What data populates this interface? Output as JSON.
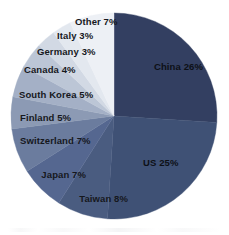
{
  "chart_data": {
    "type": "pie",
    "title": "",
    "subtitle": "",
    "xlabel": "",
    "ylabel": "",
    "legend_position": "none",
    "grid": false,
    "label_format": "{name} {value}%",
    "start_angle_deg": 0,
    "direction": "clockwise",
    "total": 100,
    "categories": [
      "China",
      "US",
      "Taiwan",
      "Japan",
      "Switzerland",
      "Finland",
      "South Korea",
      "Canada",
      "Germany",
      "Italy",
      "Other"
    ],
    "values": [
      26,
      25,
      8,
      7,
      7,
      5,
      5,
      4,
      3,
      3,
      7
    ],
    "colors": [
      "#333F61",
      "#3F5175",
      "#4A5C80",
      "#556790",
      "#6B7C9E",
      "#8C9AB4",
      "#A4B0C6",
      "#BCC6D6",
      "#D2D9E4",
      "#E3E8EF",
      "#EDF0F5"
    ],
    "slices": [
      {
        "name": "China",
        "value": 26,
        "label": "China 26%",
        "color": "#333F61",
        "label_placement": "inside",
        "label_x": 154,
        "label_y": 67,
        "align": "start"
      },
      {
        "name": "US",
        "value": 25,
        "label": "US 25%",
        "color": "#3F5175",
        "label_placement": "inside",
        "label_x": 143,
        "label_y": 163,
        "align": "start"
      },
      {
        "name": "Taiwan",
        "value": 8,
        "label": "Taiwan 8%",
        "color": "#4A5C80",
        "label_placement": "outside",
        "label_x": 128,
        "label_y": 199,
        "align": "end"
      },
      {
        "name": "Japan",
        "value": 7,
        "label": "Japan 7%",
        "color": "#556790",
        "label_placement": "outside",
        "label_x": 86,
        "label_y": 175,
        "align": "end"
      },
      {
        "name": "Switzerland",
        "value": 7,
        "label": "Switzerland 7%",
        "color": "#6B7C9E",
        "label_placement": "outside",
        "label_x": 20,
        "label_y": 141,
        "align": "start"
      },
      {
        "name": "Finland",
        "value": 5,
        "label": "Finland 5%",
        "color": "#8C9AB4",
        "label_placement": "outside",
        "label_x": 20,
        "label_y": 118,
        "align": "start"
      },
      {
        "name": "South Korea",
        "value": 5,
        "label": "South Korea 5%",
        "color": "#A4B0C6",
        "label_placement": "outside",
        "label_x": 19,
        "label_y": 95,
        "align": "start"
      },
      {
        "name": "Canada",
        "value": 4,
        "label": "Canada 4%",
        "color": "#BCC6D6",
        "label_placement": "outside",
        "label_x": 24,
        "label_y": 70,
        "align": "start"
      },
      {
        "name": "Germany",
        "value": 3,
        "label": "Germany 3%",
        "color": "#D2D9E4",
        "label_placement": "outside",
        "label_x": 37,
        "label_y": 52,
        "align": "start"
      },
      {
        "name": "Italy",
        "value": 3,
        "label": "Italy 3%",
        "color": "#E3E8EF",
        "label_placement": "outside",
        "label_x": 57,
        "label_y": 36,
        "align": "start"
      },
      {
        "name": "Other",
        "value": 7,
        "label": "Other 7%",
        "color": "#EDF0F5",
        "label_placement": "outside",
        "label_x": 75,
        "label_y": 22,
        "align": "start"
      }
    ],
    "geometry": {
      "cx": 114,
      "cy": 116,
      "r": 103
    }
  }
}
